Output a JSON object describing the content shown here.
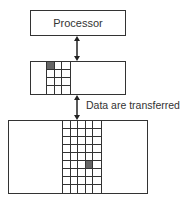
{
  "diagram": {
    "processor_label": "Processor",
    "transfer_label": "Data are transferred",
    "cache": {
      "cols": 3,
      "rows": 4,
      "highlighted": [
        [
          0,
          0
        ]
      ]
    },
    "memory": {
      "cols": 5,
      "rows": 9,
      "highlighted": [
        [
          5,
          3
        ]
      ]
    },
    "colors": {
      "line": "#333333",
      "highlight": "#666666",
      "background": "#ffffff"
    }
  }
}
